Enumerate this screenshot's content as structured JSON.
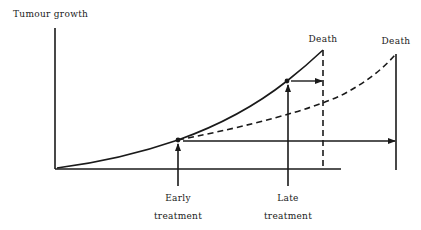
{
  "diagram": {
    "y_axis_label": "Tumour growth",
    "labels": {
      "death_untreated": "Death",
      "death_treated": "Death",
      "early_line1": "Early",
      "early_line2": "treatment",
      "late_line1": "Late",
      "late_line2": "treatment"
    },
    "colors": {
      "stroke": "#1a1a1a",
      "background": "#ffffff"
    },
    "elements": [
      {
        "id": "y-axis",
        "type": "line",
        "desc": "vertical axis"
      },
      {
        "id": "x-axis",
        "type": "line",
        "desc": "horizontal baseline"
      },
      {
        "id": "untreated-curve",
        "type": "solid-curve",
        "desc": "untreated tumour growth reaching death"
      },
      {
        "id": "treated-curve",
        "type": "dashed-curve",
        "desc": "slowed growth after early treatment reaching later death"
      },
      {
        "id": "early-treatment-point",
        "type": "dot"
      },
      {
        "id": "late-treatment-point",
        "type": "dot"
      },
      {
        "id": "early-survival-arrow",
        "type": "arrow",
        "desc": "survival gain from early treatment"
      },
      {
        "id": "late-survival-arrow",
        "type": "arrow",
        "desc": "survival gain from late treatment"
      }
    ]
  }
}
